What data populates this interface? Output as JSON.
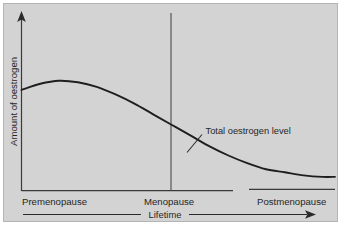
{
  "figure": {
    "background_color": "#d3d3d3",
    "page_color": "#ffffff",
    "border_color": "#b4b4b4",
    "ink_color": "#262626"
  },
  "chart_data": {
    "type": "line",
    "title": "",
    "subtitle": "",
    "xlabel": "Lifetime",
    "ylabel": "Amount of oestrogen",
    "xlim": [
      0,
      1
    ],
    "ylim": [
      0,
      1
    ],
    "grid": false,
    "legend_position": "none",
    "axis_style": {
      "x_axis_arrow": false,
      "y_axis_arrow": true,
      "tick_marks": false,
      "tick_values_shown": false
    },
    "tick_labels": {
      "x": [
        "Premenopause",
        "Menopause",
        "Postmenopause"
      ],
      "y": []
    },
    "series": [
      {
        "name": "Total oestrogen level",
        "x": [
          0.0,
          0.06,
          0.12,
          0.18,
          0.24,
          0.3,
          0.36,
          0.42,
          0.48,
          0.54,
          0.6,
          0.66,
          0.72,
          0.78,
          0.84,
          0.9,
          0.96,
          1.0
        ],
        "values": [
          0.66,
          0.7,
          0.72,
          0.71,
          0.68,
          0.63,
          0.57,
          0.5,
          0.43,
          0.36,
          0.29,
          0.23,
          0.18,
          0.14,
          0.12,
          0.1,
          0.09,
          0.09
        ]
      }
    ],
    "annotations": [
      {
        "label": "Total oestrogen level",
        "points_to_series": "Total oestrogen level",
        "anchor_x": 0.545,
        "anchor_y": 0.275
      },
      {
        "label": "Menopause",
        "type": "vertical-marker",
        "x": 0.48
      }
    ]
  },
  "labels": {
    "y_axis_title": "Amount of oestrogen",
    "x_axis_title": "Lifetime",
    "stage_premenopause": "Premenopause",
    "stage_menopause": "Menopause",
    "stage_postmenopause": "Postmenopause",
    "curve_annotation": "Total oestrogen level"
  }
}
